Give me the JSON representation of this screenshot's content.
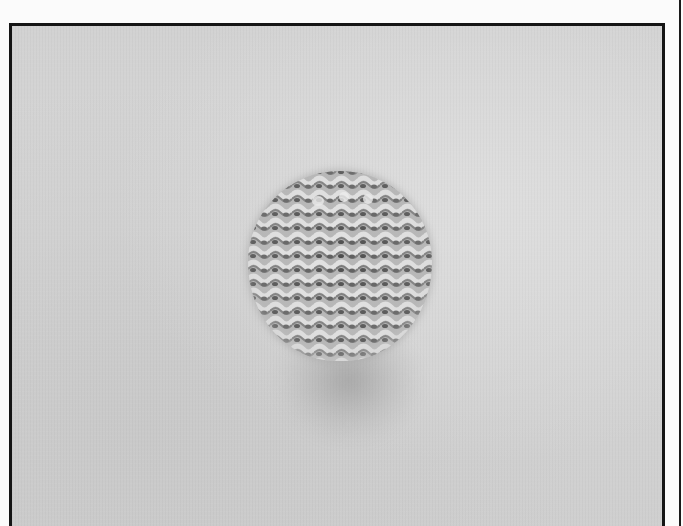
{
  "image": {
    "description": "Black-and-white photograph of a small round knitted swatch in garter stitch lying on a plain light gray surface, casting a soft shadow below",
    "subject": "knitted circular swatch",
    "stitch_pattern": "garter stitch",
    "ridge_rows": 13,
    "colors": {
      "background": "#d3d3d3",
      "frame_border": "#151515",
      "swatch_base": "#bdbdbd",
      "swatch_ridge_light": "#dcdcdc",
      "swatch_ridge_dark": "#5a5a5a",
      "page": "#fbfbfb"
    }
  }
}
